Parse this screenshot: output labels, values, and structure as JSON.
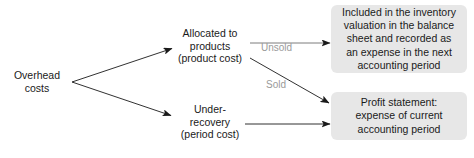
{
  "diagram": {
    "colors": {
      "box_fill": "#e7e7e7",
      "text": "#1a1a1a",
      "edge_label": "#9a9a9a",
      "arrow": "#1a1a1a",
      "background": "#ffffff"
    },
    "nodes": {
      "source": {
        "name": "overhead-costs",
        "lines": [
          "Overhead",
          "costs"
        ]
      },
      "allocated": {
        "name": "allocated-to-products",
        "lines": [
          "Allocated to",
          "products",
          "(product cost)"
        ]
      },
      "under_recovery": {
        "name": "under-recovery",
        "lines": [
          "Under-",
          "recovery",
          "(period cost)"
        ]
      },
      "inventory_box": {
        "name": "inventory-valuation-box",
        "lines": [
          "Included in the inventory",
          "valuation in the balance",
          "sheet and recorded as",
          "an expense in the next",
          "accounting period"
        ]
      },
      "profit_box": {
        "name": "profit-statement-box",
        "lines": [
          "Profit statement:",
          "expense of current",
          "accounting period"
        ]
      }
    },
    "edge_labels": {
      "unsold": "Unsold",
      "sold": "Sold"
    }
  }
}
